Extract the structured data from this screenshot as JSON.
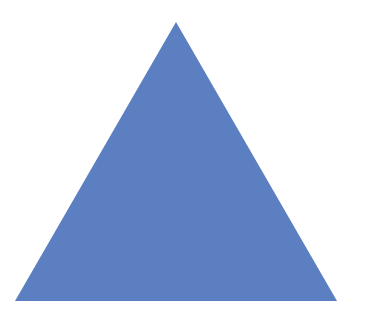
{
  "shape": {
    "type": "triangle",
    "fill_color": "#5b7fc1",
    "points": "176,22 15,301 337,301"
  },
  "background": "#ffffff"
}
